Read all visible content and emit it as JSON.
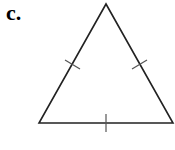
{
  "figure": {
    "label": "c.",
    "shape": "equilateral-triangle",
    "tick_marks": 3,
    "colors": {
      "stroke": "#222222",
      "background": "#ffffff"
    }
  }
}
